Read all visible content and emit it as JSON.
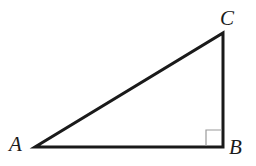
{
  "figure": {
    "name": "right-triangle-ABC",
    "background_color": "#ffffff",
    "width": 256,
    "height": 166,
    "stroke_color": "#1a1a1a",
    "stroke_width": 3,
    "right_angle_marker_color": "#9a9a9a",
    "right_angle_marker_size": 16
  },
  "labels": {
    "A": "A",
    "B": "B",
    "C": "C"
  },
  "chart_data": {
    "type": "diagram",
    "shape": "right triangle",
    "title": "",
    "vertices": [
      {
        "name": "A",
        "x": 35,
        "y": 147,
        "angle_deg": 31,
        "label_x": 15,
        "label_y": 147
      },
      {
        "name": "B",
        "x": 223,
        "y": 147,
        "angle_deg": 90,
        "label_x": 236,
        "label_y": 148
      },
      {
        "name": "C",
        "x": 223,
        "y": 33,
        "angle_deg": 59,
        "label_x": 228,
        "label_y": 19
      }
    ],
    "edges": [
      {
        "name": "AB",
        "from": "A",
        "to": "B",
        "role": "base",
        "length_px": 188
      },
      {
        "name": "BC",
        "from": "B",
        "to": "C",
        "role": "vertical-leg",
        "length_px": 114
      },
      {
        "name": "CA",
        "from": "C",
        "to": "A",
        "role": "hypotenuse",
        "length_px": 220
      }
    ],
    "markers": [
      {
        "type": "right-angle-square",
        "at_vertex": "B",
        "x": 206,
        "y": 130,
        "size": 16
      }
    ]
  }
}
